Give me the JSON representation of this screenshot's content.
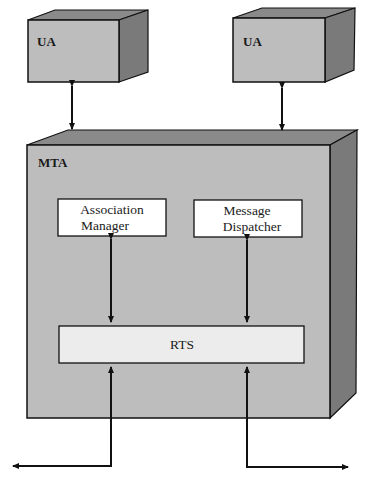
{
  "diagram": {
    "ua_left": {
      "label": "UA"
    },
    "ua_right": {
      "label": "UA"
    },
    "mta": {
      "label": "MTA"
    },
    "association_manager": {
      "line1": "Association",
      "line2": "Manager"
    },
    "message_dispatcher": {
      "line1": "Message",
      "line2": "Dispatcher"
    },
    "rts": {
      "label": "RTS"
    }
  },
  "colors": {
    "front_face": "#bdbdbd",
    "top_face": "#8a8a8a",
    "side_face": "#7a7a7a",
    "inner_box": "#ffffff",
    "rts_box": "#ececec",
    "stroke": "#111111"
  }
}
